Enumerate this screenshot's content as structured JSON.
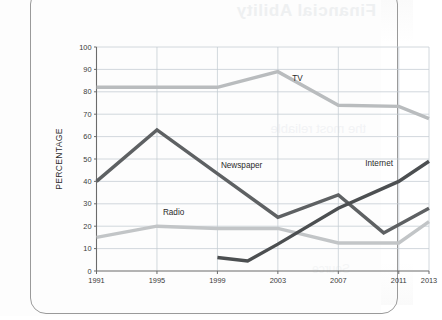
{
  "figure": {
    "background_color": "#fdfdfd",
    "showthrough_text": "Financial Ability",
    "showthrough_text_2": "the most reliable",
    "showthrough_text_3": "Source"
  },
  "chart_data": {
    "type": "line",
    "title": "",
    "xlabel": "",
    "ylabel": "PERCENTAGE",
    "x": [
      1991,
      1995,
      1999,
      2001,
      2003,
      2007,
      2010,
      2011,
      2013
    ],
    "categories": [
      "1991",
      "1995",
      "1999",
      "2003",
      "2007",
      "2011",
      "2013"
    ],
    "xtick_labels": [
      "1991",
      "1995",
      "1999",
      "2003",
      "2007",
      "2011",
      "2013"
    ],
    "xtick_values": [
      1991,
      1995,
      1999,
      2003,
      2007,
      2011,
      2013
    ],
    "ytick_labels": [
      "0",
      "10",
      "20",
      "30",
      "40",
      "50",
      "60",
      "70",
      "80",
      "90",
      "100"
    ],
    "ytick_values": [
      0,
      10,
      20,
      30,
      40,
      50,
      60,
      70,
      80,
      90,
      100
    ],
    "xlim": [
      1991,
      2013
    ],
    "ylim": [
      0,
      100
    ],
    "grid": true,
    "legend": "inline-labels",
    "series": [
      {
        "name": "TV",
        "color": "#b9bcbe",
        "line_width": 3.4,
        "label_x": 2004.3,
        "label_y": 85,
        "x": [
          1991,
          1995,
          1999,
          2003,
          2007,
          2011,
          2013
        ],
        "values": [
          82,
          82,
          82,
          89,
          74,
          73.5,
          68
        ]
      },
      {
        "name": "Newspaper",
        "color": "#5e6163",
        "line_width": 3.4,
        "label_x": 2000.6,
        "label_y": 46,
        "x": [
          1991,
          1995,
          1999,
          2003,
          2007,
          2010,
          2013
        ],
        "values": [
          40,
          63,
          43.5,
          24,
          34,
          17,
          28
        ]
      },
      {
        "name": "Radio",
        "color": "#c2c5c7",
        "line_width": 3.4,
        "label_x": 1996.1,
        "label_y": 25,
        "x": [
          1991,
          1995,
          1999,
          2003,
          2007,
          2011,
          2013
        ],
        "values": [
          15,
          20,
          19,
          19,
          12.5,
          12.5,
          22
        ]
      },
      {
        "name": "Internet",
        "color": "#4c4f51",
        "line_width": 3.4,
        "label_x": 2009.7,
        "label_y": 47,
        "x": [
          1999,
          2001,
          2003,
          2007,
          2011,
          2013
        ],
        "values": [
          6,
          4.5,
          12,
          28,
          40,
          49
        ]
      }
    ]
  }
}
